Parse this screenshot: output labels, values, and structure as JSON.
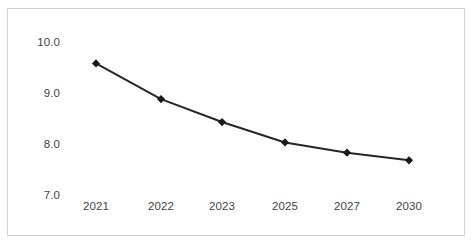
{
  "chart_data": {
    "type": "line",
    "title": "",
    "subtitle": "",
    "xlabel": "",
    "ylabel": "",
    "categories": [
      "2021",
      "2022",
      "2023",
      "2025",
      "2027",
      "2030"
    ],
    "values": [
      9.6,
      8.9,
      8.45,
      8.05,
      7.85,
      7.7
    ],
    "series": [
      {
        "name": "",
        "values": [
          9.6,
          8.9,
          8.45,
          8.05,
          7.85,
          7.7
        ]
      }
    ],
    "ylim": [
      7.0,
      10.0
    ],
    "y_ticks": [
      "7.0",
      "8.0",
      "9.0",
      "10.0"
    ],
    "y_tick_values": [
      7.0,
      8.0,
      9.0,
      10.0
    ],
    "x_ticks": [
      "2021",
      "2022",
      "2023",
      "2025",
      "2027",
      "2030"
    ],
    "grid": false,
    "legend": false,
    "legend_position": "none",
    "marker": "diamond",
    "line_color": "#262626",
    "marker_color": "#1a1a1a",
    "border_color": "#d3d3d3",
    "background_color": "#ffffff",
    "annotations": []
  }
}
